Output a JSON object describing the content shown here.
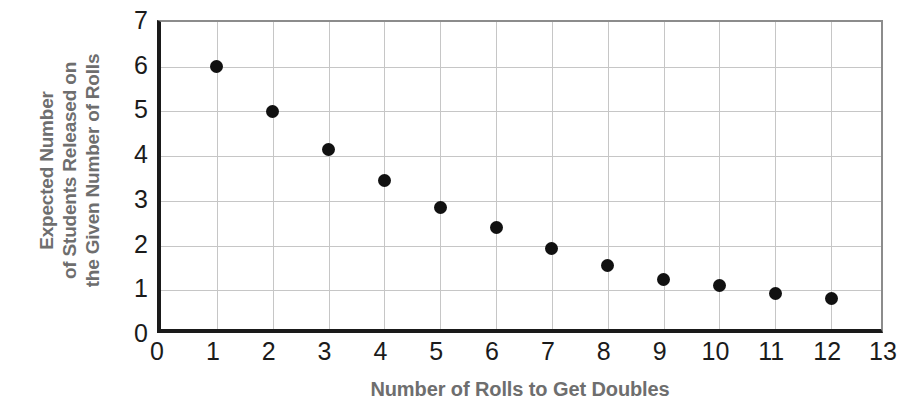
{
  "chart_data": {
    "type": "scatter",
    "title": "",
    "xlabel": "Number of Rolls to Get Doubles",
    "ylabel_lines": [
      "Expected Number",
      "of Students Released on",
      "the Given Number of Rolls"
    ],
    "ylabel": "Expected Number of Students Released on the Given Number of Rolls",
    "x": [
      1,
      2,
      3,
      4,
      5,
      6,
      7,
      8,
      9,
      10,
      11,
      12
    ],
    "values": [
      6.0,
      5.0,
      4.15,
      3.45,
      2.85,
      2.4,
      1.93,
      1.55,
      1.25,
      1.1,
      0.93,
      0.82
    ],
    "xlim": [
      0,
      13
    ],
    "ylim": [
      0,
      7
    ],
    "xticks": [
      "0",
      "1",
      "2",
      "3",
      "4",
      "5",
      "6",
      "7",
      "8",
      "9",
      "10",
      "11",
      "12",
      "13"
    ],
    "yticks": [
      "0",
      "1",
      "2",
      "3",
      "4",
      "5",
      "6",
      "7"
    ],
    "grid": true,
    "legend": false,
    "marker_color": "#111111",
    "grid_color": "#c6c6c6",
    "axis_color": "#1a1a1a",
    "label_color": "#6e6e6e"
  }
}
